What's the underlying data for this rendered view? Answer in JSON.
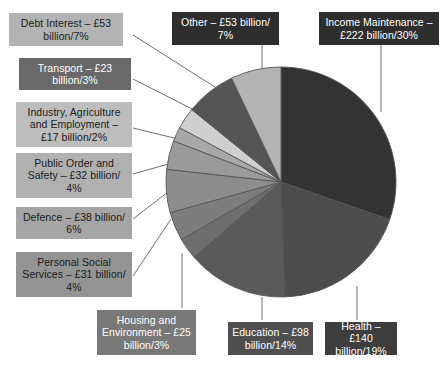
{
  "figure": {
    "type": "pie-chart-figure",
    "background": "#ffffff",
    "currency": "£",
    "unit": "billion"
  },
  "chart_data": {
    "type": "pie",
    "title": "",
    "xlabel": "",
    "ylabel": "",
    "legend_position": "callout-labels",
    "grid": false,
    "categories": [
      "Income Maintenance",
      "Health",
      "Education",
      "Housing and Environment",
      "Personal Social Services",
      "Defence",
      "Public Order and Safety",
      "Industry, Agriculture and Employment",
      "Transport",
      "Debt Interest",
      "Other"
    ],
    "values": [
      222,
      140,
      98,
      25,
      31,
      38,
      32,
      17,
      23,
      53,
      53
    ],
    "percentages": [
      30,
      19,
      14,
      3,
      4,
      6,
      4,
      2,
      3,
      7,
      7
    ],
    "value_unit": "£ billion",
    "colors": [
      "#333333",
      "#4d4d4d",
      "#5a5a5a",
      "#6e6e6e",
      "#7d7d7d",
      "#8d8d8d",
      "#9a9a9a",
      "#a8a8a8",
      "#cfcfcf",
      "#555555",
      "#b4b4b4"
    ]
  },
  "callouts": [
    {
      "key": "debt-interest",
      "name": "Debt Interest",
      "text": "Debt Interest – £53 billion/7%",
      "line1": "Debt Interest – £53",
      "line2": "billion/7%",
      "box_color": "#b3b3b3",
      "text_color": "#1b1b1b"
    },
    {
      "key": "transport",
      "name": "Transport",
      "text": "Transport – £23 billion/3%",
      "line1": "Transport – £23",
      "line2": "billion/3%",
      "box_color": "#696969",
      "text_color": "#ffffff"
    },
    {
      "key": "industry-agriculture-employment",
      "name": "Industry, Agriculture and Employment",
      "text": "Industry, Agriculture and Employment – £17 billion/2%",
      "line1": "Industry, Agriculture",
      "line2": "and Employment –",
      "line3": "£17 billion/2%",
      "box_color": "#bdbdbd",
      "text_color": "#1b1b1b"
    },
    {
      "key": "public-order-safety",
      "name": "Public Order and Safety",
      "text": "Public Order and Safety – £32 billion/4%",
      "line1": "Public Order and",
      "line2": "Safety – £32 billion/",
      "line3": "4%",
      "box_color": "#b0b0b0",
      "text_color": "#1b1b1b"
    },
    {
      "key": "defence",
      "name": "Defence",
      "text": "Defence – £38 billion/6%",
      "line1": "Defence – £38 billion/",
      "line2": "6%",
      "box_color": "#a5a5a5",
      "text_color": "#1b1b1b"
    },
    {
      "key": "personal-social-services",
      "name": "Personal Social Services",
      "text": "Personal Social Services – £31 billion/4%",
      "line1": "Personal Social",
      "line2": "Services – £31 billion/",
      "line3": "4%",
      "box_color": "#949494",
      "text_color": "#1b1b1b"
    },
    {
      "key": "housing-environment",
      "name": "Housing and Environment",
      "text": "Housing and Environment – £25 billion/3%",
      "line1": "Housing and",
      "line2": "Environment – £25",
      "line3": "billion/3%",
      "box_color": "#787878",
      "text_color": "#ffffff"
    },
    {
      "key": "education",
      "name": "Education",
      "text": "Education – £98 billion/14%",
      "line1": "Education – £98",
      "line2": "billion/14%",
      "box_color": "#4f4f4f",
      "text_color": "#ffffff"
    },
    {
      "key": "health",
      "name": "Health",
      "text": "Health – £140 billion/19%",
      "line1": "Health – £140",
      "line2": "billion/19%",
      "box_color": "#3d3d3d",
      "text_color": "#ffffff"
    },
    {
      "key": "income-maintenance",
      "name": "Income Maintenance",
      "text": "Income Maintenance – £222 billion/30%",
      "line1": "Income Maintenance –",
      "line2": "£222 billion/30%",
      "box_color": "#2e2e2e",
      "text_color": "#ffffff"
    },
    {
      "key": "other",
      "name": "Other",
      "text": "Other – £53 billion/7%",
      "line1": "Other – £53 billion/",
      "line2": "7%",
      "box_color": "#2e2e2e",
      "text_color": "#ffffff"
    }
  ]
}
